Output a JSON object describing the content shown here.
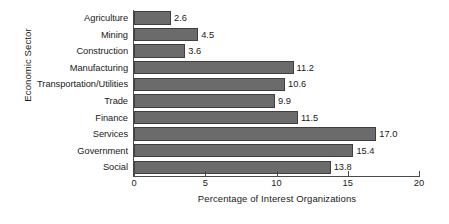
{
  "chart_data": {
    "type": "bar",
    "orientation": "horizontal",
    "title": "",
    "xlabel": "Percentage of Interest Organizations",
    "ylabel": "Economic Sector",
    "xlim": [
      0,
      20
    ],
    "xticks": [
      0,
      5,
      10,
      15,
      20
    ],
    "xtick_labels": [
      "0",
      "5",
      "10",
      "15",
      "20"
    ],
    "grid": false,
    "legend": null,
    "bar_color": "#6b6b6b",
    "bar_edge_color": "#3f3f3f",
    "axis_color": "#4a4a4a",
    "categories": [
      "Agriculture",
      "Mining",
      "Construction",
      "Manufacturing",
      "Transportation/Utilities",
      "Trade",
      "Finance",
      "Services",
      "Government",
      "Social"
    ],
    "values": [
      2.6,
      4.5,
      3.6,
      11.2,
      10.6,
      9.9,
      11.5,
      17.0,
      15.4,
      13.8
    ],
    "value_labels": [
      "2.6",
      "4.5",
      "3.6",
      "11.2",
      "10.6",
      "9.9",
      "11.5",
      "17.0",
      "15.4",
      "13.8"
    ]
  }
}
